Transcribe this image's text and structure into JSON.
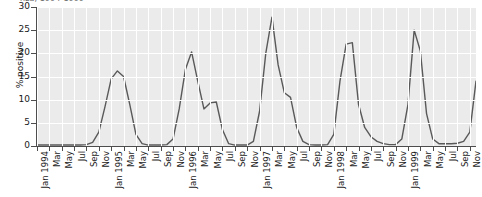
{
  "figure": {
    "title_clipped": "nza, 1994-1999",
    "background": "#ffffff",
    "plot_background": "#ebebeb",
    "grid_color": "#ffffff",
    "line_color": "#595959",
    "axis_color": "#4d4d4d"
  },
  "chart_data": {
    "type": "line",
    "title": "nza, 1994-1999",
    "xlabel": "",
    "ylabel": "% positive",
    "ylim": [
      0,
      30
    ],
    "yticks": [
      0,
      5,
      10,
      15,
      20,
      25,
      30
    ],
    "grid": true,
    "legend": "none",
    "x_tick_labels": [
      "Jan 1994",
      "Mar",
      "May",
      "Jul",
      "Sep",
      "Nov",
      "Jan 1995",
      "Mar",
      "May",
      "Jul",
      "Sep",
      "Nov",
      "Jan 1996",
      "Mar",
      "May",
      "Jul",
      "Sep",
      "Nov",
      "Jan 1997",
      "Mar",
      "May",
      "Jul",
      "Sep",
      "Nov",
      "Jan 1998",
      "Mar",
      "May",
      "Jul",
      "Sep",
      "Nov",
      "Jan 1999",
      "Mar",
      "May",
      "Jul",
      "Sep",
      "Nov"
    ],
    "x": [
      "Jan 1994",
      "Feb 1994",
      "Mar 1994",
      "Apr 1994",
      "May 1994",
      "Jun 1994",
      "Jul 1994",
      "Aug 1994",
      "Sep 1994",
      "Oct 1994",
      "Nov 1994",
      "Dec 1994",
      "Jan 1995",
      "Feb 1995",
      "Mar 1995",
      "Apr 1995",
      "May 1995",
      "Jun 1995",
      "Jul 1995",
      "Aug 1995",
      "Sep 1995",
      "Oct 1995",
      "Nov 1995",
      "Dec 1995",
      "Jan 1996",
      "Feb 1996",
      "Mar 1996",
      "Apr 1996",
      "May 1996",
      "Jun 1996",
      "Jul 1996",
      "Aug 1996",
      "Sep 1996",
      "Oct 1996",
      "Nov 1996",
      "Dec 1996",
      "Jan 1997",
      "Feb 1997",
      "Mar 1997",
      "Apr 1997",
      "May 1997",
      "Jun 1997",
      "Jul 1997",
      "Aug 1997",
      "Sep 1997",
      "Oct 1997",
      "Nov 1997",
      "Dec 1997",
      "Jan 1998",
      "Feb 1998",
      "Mar 1998",
      "Apr 1998",
      "May 1998",
      "Jun 1998",
      "Jul 1998",
      "Aug 1998",
      "Sep 1998",
      "Oct 1998",
      "Nov 1998",
      "Dec 1998",
      "Jan 1999",
      "Feb 1999",
      "Mar 1999",
      "Apr 1999",
      "May 1999",
      "Jun 1999",
      "Jul 1999",
      "Aug 1999",
      "Sep 1999",
      "Oct 1999",
      "Nov 1999",
      "Dec 1999"
    ],
    "series": [
      {
        "name": "% positive",
        "values": [
          0.2,
          0.2,
          0.2,
          0.2,
          0.2,
          0.2,
          0.2,
          0.2,
          0.3,
          0.8,
          3.0,
          8.5,
          14.5,
          16.2,
          15.0,
          9.0,
          2.5,
          0.5,
          0.2,
          0.2,
          0.2,
          0.3,
          1.5,
          8.0,
          16.5,
          20.3,
          14.0,
          8.0,
          9.3,
          9.5,
          3.5,
          0.5,
          0.2,
          0.2,
          0.2,
          1.0,
          7.5,
          20.0,
          27.8,
          17.5,
          11.5,
          10.5,
          4.0,
          1.0,
          0.3,
          0.2,
          0.2,
          0.3,
          2.5,
          14.0,
          22.0,
          22.3,
          9.0,
          4.0,
          2.0,
          1.0,
          0.5,
          0.3,
          0.3,
          1.5,
          9.0,
          25.0,
          20.5,
          7.0,
          1.5,
          0.5,
          0.5,
          0.5,
          0.6,
          1.0,
          3.0,
          14.0
        ]
      }
    ],
    "annotations": [
      {
        "label": "peak winter 1994-95",
        "value": 16.2
      },
      {
        "label": "peak winter 1995-96",
        "value": 20.3
      },
      {
        "label": "peak winter 1996-97",
        "value": 27.8
      },
      {
        "label": "peak winter 1997-98",
        "value": 22.3
      },
      {
        "label": "peak winter 1998-99",
        "value": 25.0
      }
    ]
  }
}
